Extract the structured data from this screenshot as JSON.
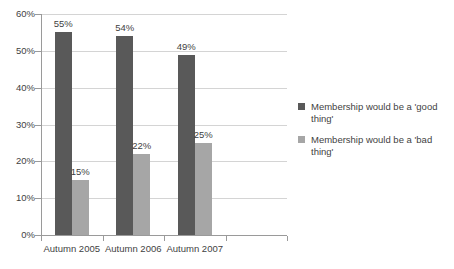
{
  "chart_data": {
    "type": "bar",
    "title": "",
    "subtitle": "",
    "xlabel": "",
    "ylabel": "",
    "ylim": [
      0,
      60
    ],
    "ytick_labels": [
      "0%",
      "10%",
      "20%",
      "30%",
      "40%",
      "50%",
      "60%"
    ],
    "ytick_values": [
      0,
      10,
      20,
      30,
      40,
      50,
      60
    ],
    "grid": true,
    "grid_axis": "y",
    "legend_position": "right",
    "categories": [
      "Autumn 2005",
      "Autumn 2006",
      "Autumn 2007",
      ""
    ],
    "series": [
      {
        "name": "Membership would be a 'good thing'",
        "color": "#595959",
        "values": [
          55,
          54,
          49,
          null
        ],
        "labels": [
          "55%",
          "54%",
          "49%",
          ""
        ]
      },
      {
        "name": "Membership would be a 'bad thing'",
        "color": "#a6a6a6",
        "values": [
          15,
          22,
          25,
          null
        ],
        "labels": [
          "15%",
          "22%",
          "25%",
          ""
        ]
      }
    ]
  },
  "axis": {
    "y": {
      "ticks": [
        {
          "label": "60%",
          "value": 60
        },
        {
          "label": "50%",
          "value": 50
        },
        {
          "label": "40%",
          "value": 40
        },
        {
          "label": "30%",
          "value": 30
        },
        {
          "label": "20%",
          "value": 20
        },
        {
          "label": "10%",
          "value": 10
        },
        {
          "label": "0%",
          "value": 0
        }
      ]
    },
    "x": {
      "categories": [
        {
          "label": "Autumn 2005"
        },
        {
          "label": "Autumn 2006"
        },
        {
          "label": "Autumn 2007"
        },
        {
          "label": ""
        }
      ]
    }
  },
  "legend": {
    "items": [
      {
        "label": "Membership would be a 'good thing'",
        "color": "#595959"
      },
      {
        "label": "Membership would be a 'bad thing'",
        "color": "#a6a6a6"
      }
    ]
  },
  "colors": {
    "good": "#595959",
    "bad": "#a6a6a6",
    "gridline": "#d4d4d4",
    "axis": "#9a9a9a",
    "text": "#3f3f3f",
    "background": "#ffffff"
  }
}
